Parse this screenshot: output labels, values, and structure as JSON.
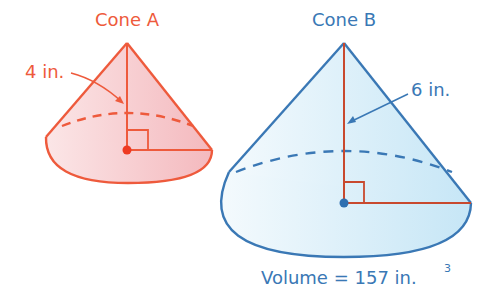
{
  "cone_a": {
    "title": "Cone A",
    "height_label": "4 in.",
    "color": "#ee5a3c",
    "fill": "#f6c9cc"
  },
  "cone_b": {
    "title": "Cone B",
    "height_label": "6 in.",
    "volume_label": "Volume = 157 in.",
    "volume_exponent": "3",
    "color": "#3a78b5",
    "fill": "#d4ecf8",
    "height_line_color": "#c8492e"
  }
}
